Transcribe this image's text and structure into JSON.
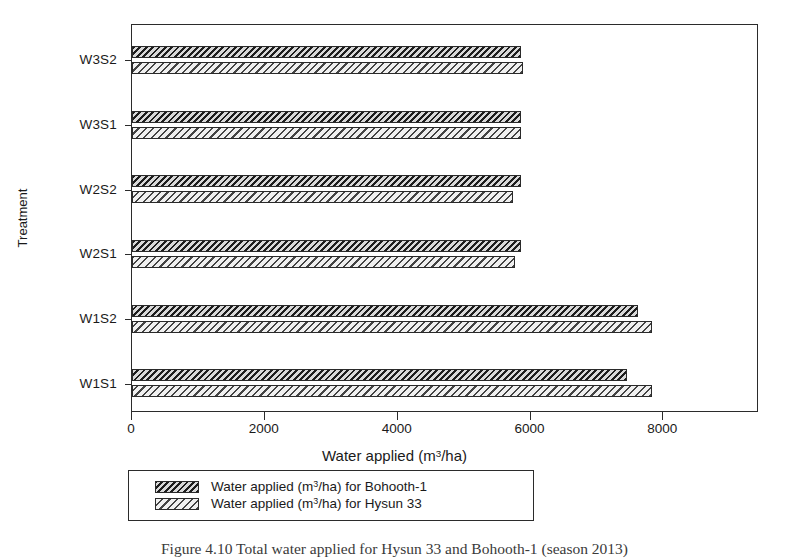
{
  "chart_data": {
    "type": "bar",
    "orientation": "horizontal",
    "title": "",
    "xlabel_text": "Water applied (m",
    "xlabel_sup": "3",
    "xlabel_tail": "/ha)",
    "xlabel": "Water applied (m3/ha)",
    "ylabel": "Treatment",
    "categories": [
      "W1S1",
      "W1S2",
      "W2S1",
      "W2S2",
      "W3S1",
      "W3S2"
    ],
    "xlim": [
      0,
      9440
    ],
    "ylim_note": "categorical",
    "xticks": [
      0,
      2000,
      4000,
      6000,
      8000
    ],
    "xtick_labels": [
      "0",
      "2000",
      "4000",
      "6000",
      "8000"
    ],
    "grid": false,
    "legend_position": "below-axes",
    "series": [
      {
        "name": "Water applied (m3/ha) for Bohooth-1",
        "name_text": "Water applied (m",
        "name_sup": "3",
        "name_tail": "/ha) for Bohooth-1",
        "fill": "dark-hatch",
        "values": [
          7450,
          7620,
          5860,
          5860,
          5860,
          5860
        ]
      },
      {
        "name": "Water applied (m3/ha) for Hysun 33",
        "name_text": "Water applied (m",
        "name_sup": "3",
        "name_tail": "/ha) for Hysun 33",
        "fill": "light-hatch",
        "values": [
          7830,
          7830,
          5760,
          5740,
          5860,
          5880
        ]
      }
    ],
    "colors": {
      "axis": "#2b2b2b",
      "series_a": "#585858",
      "series_b": "#9c9c9c",
      "background": "#ffffff"
    }
  },
  "caption": {
    "text": "Figure 4.10  Total water applied for Hysun 33 and Bohooth-1 (season 2013)"
  },
  "icons": {
    "legend_swatch_a": "hatch-swatch-dark-icon",
    "legend_swatch_b": "hatch-swatch-light-icon"
  }
}
